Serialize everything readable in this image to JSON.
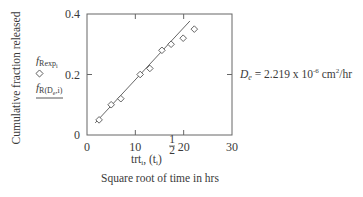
{
  "chart_data": {
    "type": "scatter",
    "title": "",
    "xlabel_line1_main": "trt",
    "xlabel_line1_sub": "i",
    "xlabel_line1_mid": ", (t",
    "xlabel_line1_sub2": "i",
    "xlabel_line1_end": ")",
    "xlabel_exponent_num": "1",
    "xlabel_exponent_den": "2",
    "xlabel_line2": "Square root of time in hrs",
    "ylabel": "Cumulative fraction released",
    "xlim": [
      0,
      30
    ],
    "ylim": [
      0,
      0.4
    ],
    "x_ticks": [
      0,
      10,
      20,
      30
    ],
    "x_tick_labels": [
      "0",
      "10",
      "20",
      "30"
    ],
    "y_ticks": [
      0,
      0.2,
      0.4
    ],
    "y_tick_labels": [
      "0",
      "0.2",
      "0.4"
    ],
    "grid": false,
    "series": [
      {
        "name": "f_Rexp,i",
        "kind": "markers",
        "marker": "diamond",
        "x": [
          2.5,
          5.0,
          7.0,
          11.0,
          13.0,
          15.5,
          17.4,
          19.9,
          22.2
        ],
        "y": [
          0.05,
          0.1,
          0.12,
          0.2,
          0.22,
          0.28,
          0.3,
          0.32,
          0.35
        ]
      },
      {
        "name": "f_R(De,i)",
        "kind": "line",
        "x": [
          1.7,
          21.3
        ],
        "y": [
          0.04,
          0.377
        ]
      }
    ],
    "legend": {
      "placement": "left",
      "entries": [
        {
          "main": "f",
          "sub": "Rexp",
          "subsub": "i",
          "symbol": "diamond"
        },
        {
          "main": "f",
          "sub": "R(D",
          "subsub": "e",
          "tail": ",i)",
          "symbol": "line"
        }
      ]
    },
    "annotation": {
      "label_main": "D",
      "label_sub": "e",
      "equals": " = 2.219 x 10",
      "exponent": "-6",
      "unit": " cm",
      "unit_exp": "2",
      "unit_tail": "/hr"
    }
  }
}
